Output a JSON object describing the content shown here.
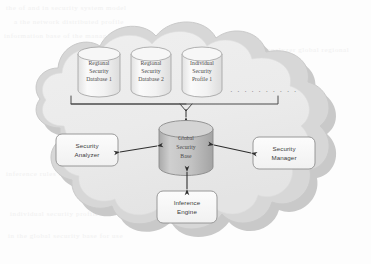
{
  "diagram": {
    "cloud": {
      "name": "security-cloud-boundary",
      "fill_color": "#ebebeb",
      "outline_color": "#bfbfbf",
      "shadow_color": "#c9c9c9"
    },
    "databases": [
      {
        "id": "regional-security-database-1",
        "line1": "Regional",
        "line2": "Security",
        "line3": "Database 1"
      },
      {
        "id": "regional-security-database-2",
        "line1": "Regional",
        "line2": "Security",
        "line3": "Database 2"
      },
      {
        "id": "individual-security-profile-1",
        "line1": "Individual",
        "line2": "Security",
        "line3": "Profile 1"
      }
    ],
    "ellipsis": "· · · · · · · · · ·",
    "central_store": {
      "id": "global-security-base",
      "line1": "Global",
      "line2": "Security",
      "line3": "Base",
      "fill_color": "#b9b9b9",
      "top_color": "#d2d2d2"
    },
    "components": [
      {
        "id": "security-analyzer",
        "line1": "Security",
        "line2": "Analyzer"
      },
      {
        "id": "security-manager",
        "line1": "Security",
        "line2": "Manager"
      },
      {
        "id": "inference-engine",
        "line1": "Inference",
        "line2": "Engine"
      }
    ],
    "connectors": [
      {
        "id": "aggregation-bracket",
        "type": "bracket",
        "from": "databases",
        "to": "global-security-base"
      },
      {
        "id": "analyzer-link",
        "type": "double-arrow",
        "from": "security-analyzer",
        "to": "global-security-base"
      },
      {
        "id": "manager-link",
        "type": "double-arrow",
        "from": "global-security-base",
        "to": "security-manager"
      },
      {
        "id": "inference-link",
        "type": "double-arrow",
        "from": "global-security-base",
        "to": "inference-engine"
      }
    ],
    "background_ghost_lines": [
      "the  of  and  in  security  system  model",
      "a  the  network  distributed  profile",
      "information  base  of  the  manager  engine",
      "security  analyzer  global  regional",
      "inference  rules  applied  to  the  data",
      "individual  security  profiles  stored",
      "in  the  global  security  base  for  use"
    ]
  }
}
